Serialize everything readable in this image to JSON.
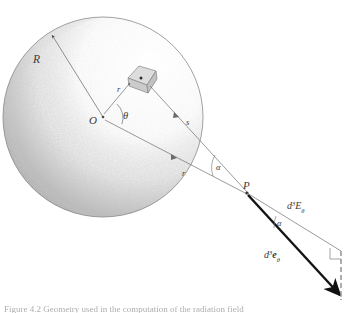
{
  "figure": {
    "domain_type": "diagram",
    "background_color": "#ffffff",
    "ink_color": "#3a3a3a",
    "shading_color": "#9a9a9a",
    "arrow_color": "#1a1a1a",
    "caption": "Figure 4.2  Geometry used in the computation of the radiation field"
  },
  "sphere": {
    "label_radius": "R",
    "label_center": "O",
    "center_px": {
      "x": 103,
      "y": 117
    },
    "radius_px": 100,
    "surface_point_px": {
      "x": 50,
      "y": 33
    }
  },
  "volume_element": {
    "label": "",
    "center_px": {
      "x": 143,
      "y": 76
    },
    "description": "small cube representing the differential volume element dV"
  },
  "angles": {
    "theta": "θ",
    "alpha_inner": "α",
    "alpha_outer": "α"
  },
  "distances": {
    "r_inner": "r",
    "s_ray": "s",
    "r_chord": "r"
  },
  "points": {
    "P": "P"
  },
  "flux_labels": {
    "incident": "d³E",
    "incident_superscript": "3",
    "incident_base": "E",
    "incident_subscript": "θ",
    "emergent_base": "e",
    "emergent_subscript": "θ"
  },
  "markers": {
    "right_angle": "right-angle marker at dashed reference line",
    "arrowhead": "bold arrowhead terminating the emergent flux vector"
  }
}
